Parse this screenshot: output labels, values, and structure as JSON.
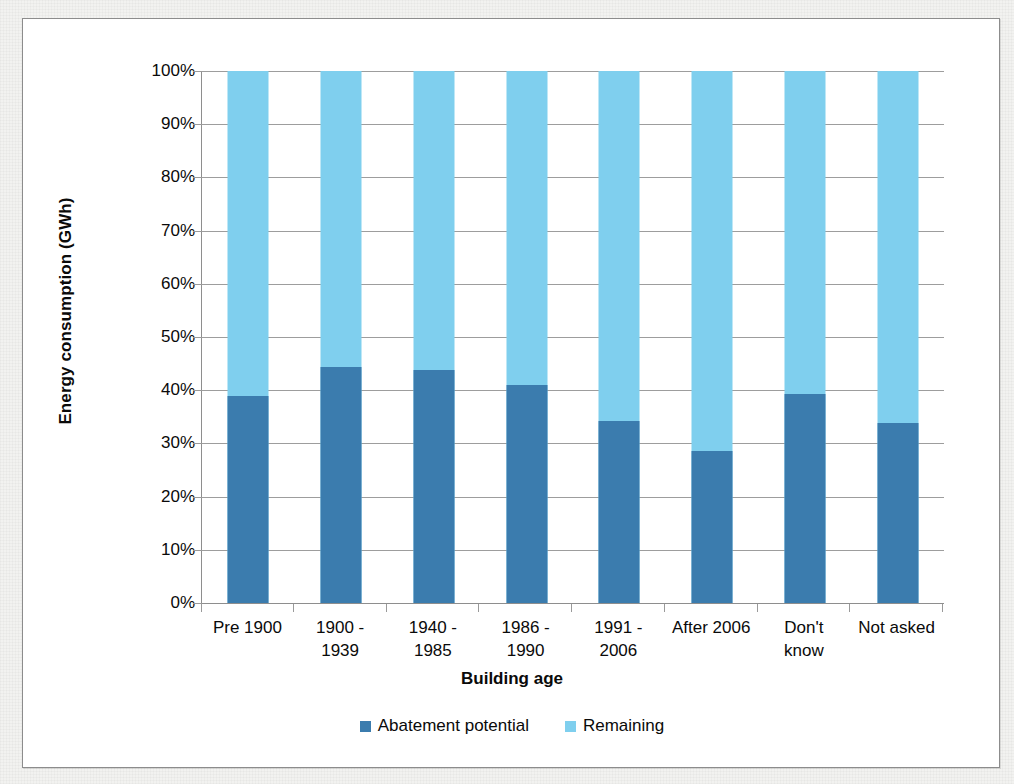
{
  "chart_data": {
    "type": "bar",
    "subtype": "stacked-100-percent-column",
    "title": "",
    "xlabel": "Building age",
    "ylabel": "Energy consumption (GWh)",
    "categories": [
      "Pre 1900",
      "1900 -\n1939",
      "1940 -\n1985",
      "1986 -\n1990",
      "1991 -\n2006",
      "After 2006",
      "Don't\nknow",
      "Not asked"
    ],
    "series": [
      {
        "name": "Abatement potential",
        "color": "#3b7cae",
        "values": [
          39.0,
          44.4,
          43.8,
          41.0,
          34.3,
          28.5,
          39.2,
          33.9
        ]
      },
      {
        "name": "Remaining",
        "color": "#7fcfee",
        "values": [
          61.0,
          55.6,
          56.2,
          59.0,
          65.7,
          71.5,
          60.8,
          66.1
        ]
      }
    ],
    "ylim": [
      0,
      100
    ],
    "ytick_labels": [
      "100%",
      "90%",
      "80%",
      "70%",
      "60%",
      "50%",
      "40%",
      "30%",
      "20%",
      "10%",
      "0%"
    ],
    "ytick_values": [
      100,
      90,
      80,
      70,
      60,
      50,
      40,
      30,
      20,
      10,
      0
    ],
    "grid": "horizontal",
    "legend_position": "bottom",
    "legend_entries": [
      "Abatement potential",
      "Remaining"
    ]
  },
  "legend": {
    "items": [
      {
        "label": "Abatement potential",
        "color": "#3b7cae"
      },
      {
        "label": "Remaining",
        "color": "#7fcfee"
      }
    ]
  },
  "colors": {
    "abatement": "#3b7cae",
    "remaining": "#7fcfee",
    "gridline": "#9d9d9d",
    "axis": "#8e8e8e",
    "frame": "#8c8c8c",
    "page_background": "#f2f2f0",
    "plot_background": "#ffffff"
  }
}
